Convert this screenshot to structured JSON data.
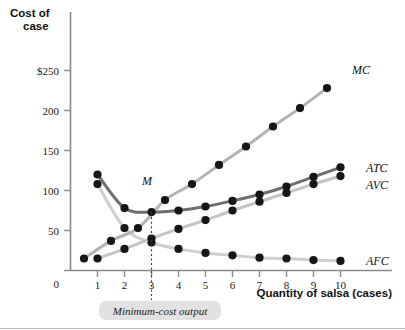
{
  "chart_data": {
    "type": "line",
    "title": "",
    "ylabel_line1": "Cost of",
    "ylabel_line2": "case",
    "xlabel": "Quantity of salsa (cases)",
    "xlim": [
      0,
      10.6
    ],
    "ylim": [
      0,
      265
    ],
    "grid": false,
    "legend_position": "right-of-curve-ends",
    "x_ticks": [
      "1",
      "2",
      "3",
      "4",
      "5",
      "6",
      "7",
      "8",
      "9",
      "10"
    ],
    "x_tick_values": [
      1,
      2,
      3,
      4,
      5,
      6,
      7,
      8,
      9,
      10
    ],
    "y_ticks": [
      "0",
      "50",
      "100",
      "150",
      "200",
      "$250"
    ],
    "y_tick_values": [
      0,
      50,
      100,
      150,
      200,
      250
    ],
    "series": [
      {
        "name": "MC",
        "label": "MC",
        "color": "#b3b3b3",
        "x": [
          0.5,
          1.5,
          2.5,
          3.5,
          4.5,
          5.5,
          6.5,
          7.5,
          8.5,
          9.5
        ],
        "values": [
          15,
          37,
          53,
          88,
          108,
          132,
          155,
          180,
          203,
          228
        ]
      },
      {
        "name": "ATC",
        "label": "ATC",
        "color": "#6e6e6e",
        "x": [
          1,
          2,
          3,
          4,
          5,
          6,
          7,
          8,
          9,
          10
        ],
        "values": [
          120,
          78,
          73,
          75,
          80,
          87,
          95,
          105,
          117,
          129
        ]
      },
      {
        "name": "AVC",
        "label": "AVC",
        "color": "#c4c4c4",
        "x": [
          1,
          2,
          3,
          4,
          5,
          6,
          7,
          8,
          9,
          10
        ],
        "values": [
          15,
          27,
          40,
          52,
          63,
          75,
          86,
          97,
          108,
          118
        ]
      },
      {
        "name": "AFC",
        "label": "AFC",
        "color": "#cfcfcf",
        "x": [
          1,
          2,
          3,
          4,
          5,
          6,
          7,
          8,
          9,
          10
        ],
        "values": [
          108,
          53,
          35,
          27,
          22,
          19,
          16,
          15,
          13,
          12
        ]
      }
    ],
    "annotations": [
      {
        "name": "minimum-cost-point",
        "label": "M",
        "x": 3,
        "y": 73,
        "description": "Minimum point of the ATC curve"
      },
      {
        "name": "minimum-cost-callout",
        "label": "Minimum-cost output",
        "x": 3
      }
    ]
  },
  "axes": {
    "y_title_line1": "Cost of",
    "y_title_line2": "case",
    "x_title": "Quantity of salsa (cases)"
  },
  "colors": {
    "mc": "#b3b3b3",
    "atc": "#6e6e6e",
    "avc": "#c4c4c4",
    "afc": "#cfcfcf",
    "marker": "#161616",
    "axis": "#8a8a8a",
    "callout_bg": "#e2e2e2"
  }
}
